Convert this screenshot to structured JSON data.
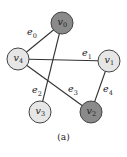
{
  "figure": {
    "caption": "(a)",
    "nodes": [
      {
        "id": "v0",
        "base": "v",
        "sub": "0",
        "cx": 62,
        "cy": 23,
        "fill": "#8a8a8a"
      },
      {
        "id": "v1",
        "base": "v",
        "sub": "1",
        "cx": 109,
        "cy": 61,
        "fill": "#e6e6e6"
      },
      {
        "id": "v2",
        "base": "v",
        "sub": "2",
        "cx": 91,
        "cy": 112,
        "fill": "#8a8a8a"
      },
      {
        "id": "v3",
        "base": "v",
        "sub": "3",
        "cx": 40,
        "cy": 112,
        "fill": "#e6e6e6"
      },
      {
        "id": "v4",
        "base": "v",
        "sub": "4",
        "cx": 18,
        "cy": 59,
        "fill": "#e6e6e6"
      }
    ],
    "edges": [
      {
        "id": "e0",
        "base": "e",
        "sub": "0",
        "from": "v4",
        "to": "v0",
        "lx": 27,
        "ly": 35
      },
      {
        "id": "e1",
        "base": "e",
        "sub": "1",
        "from": "v4",
        "to": "v1",
        "lx": 82,
        "ly": 56
      },
      {
        "id": "e2",
        "base": "e",
        "sub": "2",
        "from": "v0",
        "to": "v3",
        "lx": 32,
        "ly": 93
      },
      {
        "id": "e3",
        "base": "e",
        "sub": "3",
        "from": "v4",
        "to": "v2",
        "lx": 68,
        "ly": 92
      },
      {
        "id": "e4",
        "base": "e",
        "sub": "4",
        "from": "v1",
        "to": "v2",
        "lx": 103,
        "ly": 92
      }
    ],
    "node_radius": 11,
    "colors": {
      "dark_node": "#8a8a8a",
      "light_node": "#e6e6e6",
      "edge": "#333333"
    }
  }
}
